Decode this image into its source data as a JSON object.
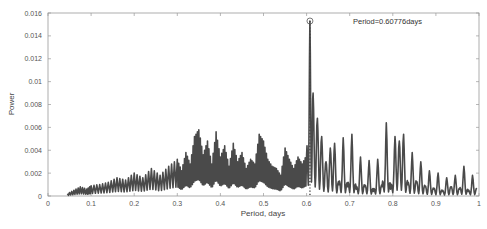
{
  "chart_data": {
    "type": "line",
    "title": "",
    "xlabel": "Period, days",
    "ylabel": "Power",
    "xlim": [
      0,
      1
    ],
    "ylim": [
      0,
      0.016
    ],
    "grid": false,
    "xticks": [
      "0",
      "0.1",
      "0.2",
      "0.3",
      "0.4",
      "0.5",
      "0.6",
      "0.7",
      "0.8",
      "0.9",
      "1"
    ],
    "yticks": [
      "0",
      "0.002",
      "0.004",
      "0.006",
      "0.008",
      "0.01",
      "0.012",
      "0.014",
      "0.016"
    ],
    "annotation": {
      "text": "Period=0.60776days",
      "x": 0.60776,
      "y": 0.0153,
      "marker": "circle"
    },
    "series": [
      {
        "name": "periodogram",
        "color": "#4a4a4a",
        "x": [
          0.045,
          0.06,
          0.075,
          0.09,
          0.1,
          0.12,
          0.14,
          0.16,
          0.18,
          0.2,
          0.22,
          0.24,
          0.26,
          0.28,
          0.3,
          0.31,
          0.32,
          0.33,
          0.34,
          0.35,
          0.36,
          0.37,
          0.38,
          0.39,
          0.4,
          0.41,
          0.42,
          0.43,
          0.44,
          0.45,
          0.46,
          0.47,
          0.48,
          0.49,
          0.5,
          0.51,
          0.52,
          0.53,
          0.54,
          0.55,
          0.56,
          0.57,
          0.58,
          0.59,
          0.6,
          0.60776,
          0.615,
          0.625,
          0.635,
          0.645,
          0.655,
          0.665,
          0.675,
          0.685,
          0.695,
          0.705,
          0.715,
          0.725,
          0.735,
          0.745,
          0.755,
          0.765,
          0.775,
          0.785,
          0.795,
          0.805,
          0.815,
          0.825,
          0.835,
          0.845,
          0.855,
          0.865,
          0.875,
          0.885,
          0.895,
          0.905,
          0.915,
          0.925,
          0.935,
          0.945,
          0.955,
          0.965,
          0.975,
          0.985,
          0.995
        ],
        "y": [
          0.0002,
          0.0005,
          0.0008,
          0.0006,
          0.0009,
          0.001,
          0.0012,
          0.0016,
          0.0014,
          0.002,
          0.0016,
          0.0024,
          0.0018,
          0.0026,
          0.0032,
          0.0022,
          0.0038,
          0.0028,
          0.0052,
          0.0058,
          0.0036,
          0.0048,
          0.0028,
          0.0056,
          0.0034,
          0.0044,
          0.0026,
          0.0046,
          0.003,
          0.0038,
          0.0024,
          0.0032,
          0.0028,
          0.0054,
          0.0048,
          0.0032,
          0.0026,
          0.0024,
          0.0018,
          0.0042,
          0.0032,
          0.0024,
          0.0034,
          0.0028,
          0.0036,
          0.0153,
          0.009,
          0.0068,
          0.0052,
          0.003,
          0.0042,
          0.0046,
          0.001,
          0.0051,
          0.0008,
          0.0054,
          0.0006,
          0.0034,
          0.0008,
          0.0031,
          0.0004,
          0.0032,
          0.0008,
          0.0064,
          0.0006,
          0.0052,
          0.0048,
          0.0054,
          0.001,
          0.0038,
          0.0012,
          0.003,
          0.0008,
          0.0022,
          0.0006,
          0.002,
          0.0004,
          0.0016,
          0.0008,
          0.0018,
          0.0006,
          0.0026,
          0.0004,
          0.0018,
          0.0006
        ]
      }
    ]
  }
}
